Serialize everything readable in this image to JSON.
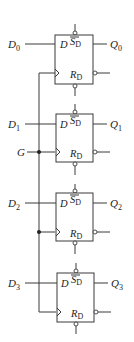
{
  "diagram": {
    "type": "circuit-schematic",
    "clock": {
      "label": "G"
    },
    "flipflops": [
      {
        "input": "D",
        "input_sub": "0",
        "output": "Q",
        "output_sub": "0",
        "pin_d": "D",
        "set": "S",
        "set_sub": "D",
        "reset": "R",
        "reset_sub": "D"
      },
      {
        "input": "D",
        "input_sub": "1",
        "output": "Q",
        "output_sub": "1",
        "pin_d": "D",
        "set": "S",
        "set_sub": "D",
        "reset": "R",
        "reset_sub": "D"
      },
      {
        "input": "D",
        "input_sub": "2",
        "output": "Q",
        "output_sub": "2",
        "pin_d": "D",
        "set": "S",
        "set_sub": "D",
        "reset": "R",
        "reset_sub": "D"
      },
      {
        "input": "D",
        "input_sub": "3",
        "output": "Q",
        "output_sub": "3",
        "pin_d": "D",
        "set": "S",
        "set_sub": "D",
        "reset": "R",
        "reset_sub": "D"
      }
    ],
    "colors": {
      "line": "#3a3a3a",
      "text": "#222222",
      "background": "#ffffff"
    }
  }
}
